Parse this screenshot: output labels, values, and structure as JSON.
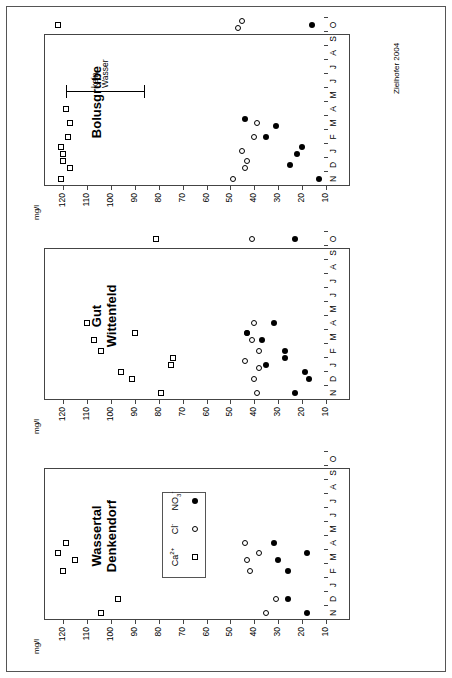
{
  "figure": {
    "credit": "Zielhofer 2004",
    "y_axis_unit": "mg/l",
    "y_ticks": [
      120,
      110,
      100,
      90,
      80,
      70,
      60,
      50,
      40,
      30,
      20,
      10
    ],
    "y_min": 0,
    "y_max": 128,
    "x_ticks": [
      "N",
      "D",
      "J",
      "F",
      "M",
      "A",
      "M",
      "J",
      "J",
      "A",
      "S",
      "O"
    ],
    "legend": {
      "items": [
        {
          "label": "Ca",
          "sup": "2+",
          "sub": "",
          "marker": "open-square",
          "name": "calcium"
        },
        {
          "label": "Cl",
          "sup": "-",
          "sub": "",
          "marker": "open-circle",
          "name": "chloride"
        },
        {
          "label": "NO",
          "sup": "-",
          "sub": "3",
          "marker": "filled-circle",
          "name": "nitrate"
        }
      ]
    },
    "annotation": {
      "text": "kein\nWasser"
    }
  },
  "chart_data": {
    "type": "scatter",
    "xlabel": "",
    "ylabel": "mg/l",
    "ylim": [
      0,
      128
    ],
    "grid": false,
    "legend_position": "panel-1-center",
    "x_categories": [
      "N",
      "D",
      "J",
      "F",
      "M",
      "A",
      "M",
      "J",
      "J",
      "A",
      "S",
      "O"
    ],
    "panels": [
      {
        "name": "Wassertal Denkendorf",
        "title": "Wassertal\nDenkendorf",
        "series": [
          {
            "name": "Ca2+",
            "marker": "open-square",
            "points": [
              {
                "x": "N",
                "y": 104
              },
              {
                "x": "D",
                "y": 97
              },
              {
                "x": "F",
                "y": 120
              },
              {
                "x": "M",
                "y": 115
              },
              {
                "x": "A",
                "y": 119
              },
              {
                "x": "M",
                "y": 122
              }
            ]
          },
          {
            "name": "Cl-",
            "marker": "open-circle",
            "points": [
              {
                "x": "N",
                "y": 35
              },
              {
                "x": "D",
                "y": 31
              },
              {
                "x": "F",
                "y": 42
              },
              {
                "x": "M",
                "y": 43
              },
              {
                "x": "A",
                "y": 44
              },
              {
                "x": "M",
                "y": 38
              }
            ]
          },
          {
            "name": "NO3-",
            "marker": "filled-circle",
            "points": [
              {
                "x": "N",
                "y": 18
              },
              {
                "x": "D",
                "y": 26
              },
              {
                "x": "F",
                "y": 26
              },
              {
                "x": "M",
                "y": 30
              },
              {
                "x": "A",
                "y": 32
              },
              {
                "x": "M",
                "y": 18
              }
            ]
          }
        ]
      },
      {
        "name": "Gut Wittenfeld",
        "title": "Gut\nWittenfeld",
        "series": [
          {
            "name": "Ca2+",
            "marker": "open-square",
            "points": [
              {
                "x": "N",
                "y": 79
              },
              {
                "x": "D",
                "y": 91
              },
              {
                "x": "J",
                "y": 96
              },
              {
                "x": "F",
                "y": 104
              },
              {
                "x": "M",
                "y": 107
              },
              {
                "x": "A",
                "y": 110
              },
              {
                "x": "M",
                "y": 90
              },
              {
                "x": "J",
                "y": 75
              },
              {
                "x": "J",
                "y": 74
              },
              {
                "x": "O",
                "y": 81
              }
            ]
          },
          {
            "name": "Cl-",
            "marker": "open-circle",
            "points": [
              {
                "x": "N",
                "y": 39
              },
              {
                "x": "D",
                "y": 40
              },
              {
                "x": "J",
                "y": 38
              },
              {
                "x": "F",
                "y": 38
              },
              {
                "x": "M",
                "y": 41
              },
              {
                "x": "A",
                "y": 40
              },
              {
                "x": "M",
                "y": 43
              },
              {
                "x": "J",
                "y": 44
              },
              {
                "x": "O",
                "y": 41
              }
            ]
          },
          {
            "name": "NO3-",
            "marker": "filled-circle",
            "points": [
              {
                "x": "N",
                "y": 23
              },
              {
                "x": "D",
                "y": 17
              },
              {
                "x": "J",
                "y": 19
              },
              {
                "x": "F",
                "y": 27
              },
              {
                "x": "M",
                "y": 37
              },
              {
                "x": "A",
                "y": 32
              },
              {
                "x": "M",
                "y": 43
              },
              {
                "x": "J",
                "y": 35
              },
              {
                "x": "J",
                "y": 27
              },
              {
                "x": "O",
                "y": 23
              }
            ]
          }
        ]
      },
      {
        "name": "Bolusgrube",
        "title": "Bolusgrube",
        "series": [
          {
            "name": "Ca2+",
            "marker": "open-square",
            "points": [
              {
                "x": "N",
                "y": 121
              },
              {
                "x": "D",
                "y": 117
              },
              {
                "x": "D",
                "y": 120
              },
              {
                "x": "J",
                "y": 120
              },
              {
                "x": "J",
                "y": 121
              },
              {
                "x": "F",
                "y": 118
              },
              {
                "x": "M",
                "y": 117
              },
              {
                "x": "A",
                "y": 119
              },
              {
                "x": "O",
                "y": 122
              }
            ]
          },
          {
            "name": "Cl-",
            "marker": "open-circle",
            "points": [
              {
                "x": "N",
                "y": 49
              },
              {
                "x": "D",
                "y": 44
              },
              {
                "x": "D",
                "y": 43
              },
              {
                "x": "J",
                "y": 45
              },
              {
                "x": "F",
                "y": 40
              },
              {
                "x": "M",
                "y": 39
              },
              {
                "x": "O",
                "y": 47
              },
              {
                "x": "O",
                "y": 45
              }
            ]
          },
          {
            "name": "NO3-",
            "marker": "filled-circle",
            "points": [
              {
                "x": "N",
                "y": 13
              },
              {
                "x": "D",
                "y": 25
              },
              {
                "x": "J",
                "y": 22
              },
              {
                "x": "J",
                "y": 20
              },
              {
                "x": "F",
                "y": 35
              },
              {
                "x": "M",
                "y": 31
              },
              {
                "x": "M",
                "y": 44
              },
              {
                "x": "O",
                "y": 16
              }
            ]
          }
        ]
      }
    ]
  }
}
